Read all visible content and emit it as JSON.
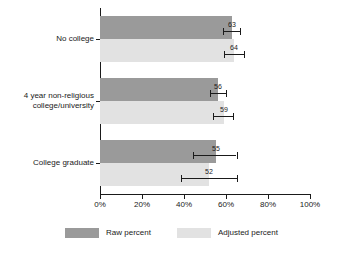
{
  "chart_data": {
    "type": "bar",
    "orientation": "horizontal",
    "title": "",
    "xlabel": "",
    "ylabel": "",
    "xlim": [
      0,
      100
    ],
    "xticks": [
      0,
      20,
      40,
      60,
      80,
      100
    ],
    "xticklabels": [
      "0%",
      "20%",
      "40%",
      "60%",
      "80%",
      "100%"
    ],
    "grid": false,
    "legend_position": "bottom",
    "categories": [
      "No college",
      "4 year non-religious college/university",
      "College graduate"
    ],
    "series": [
      {
        "name": "Raw percent",
        "color": "#9a9a9a",
        "values": [
          63,
          56,
          55
        ],
        "error_low": [
          58.5,
          52.5,
          44.5
        ],
        "error_high": [
          66.5,
          60.0,
          65.0
        ]
      },
      {
        "name": "Adjusted percent",
        "color": "#e2e2e2",
        "values": [
          64,
          59,
          52
        ],
        "error_low": [
          59.0,
          54.0,
          38.5
        ],
        "error_high": [
          68.5,
          63.5,
          65.0
        ]
      }
    ]
  },
  "legend": {
    "entries": [
      {
        "label": "Raw percent",
        "swatch": "raw"
      },
      {
        "label": "Adjusted percent",
        "swatch": "adj"
      }
    ]
  },
  "categories_display": [
    {
      "line1": "No college",
      "line2": ""
    },
    {
      "line1": "4 year non-religious",
      "line2": "college/university"
    },
    {
      "line1": "College graduate",
      "line2": ""
    }
  ]
}
